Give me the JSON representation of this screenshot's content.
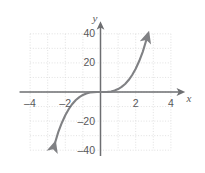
{
  "chart_data": {
    "type": "line",
    "title": "",
    "xlabel": "x",
    "ylabel": "y",
    "xlim": [
      -4.4,
      4.4
    ],
    "ylim": [
      -44,
      44
    ],
    "grid": true,
    "grid_style": "dotted",
    "legend": "none",
    "x_ticks": [
      -4,
      -2,
      2,
      4
    ],
    "x_tick_labels": [
      "–4",
      "–2",
      "2",
      "4"
    ],
    "y_ticks": [
      40,
      20,
      -20,
      -40
    ],
    "y_tick_labels": [
      "40",
      "20",
      "–20",
      "–40"
    ],
    "x_gridline_values": [
      -4,
      -3,
      -2,
      -1,
      0,
      1,
      2,
      3,
      4
    ],
    "y_gridline_values": [
      -40,
      -30,
      -20,
      -10,
      0,
      10,
      20,
      30,
      40
    ],
    "series": [
      {
        "name": "cubic",
        "equation": "y = x³",
        "arrow_start": true,
        "arrow_end": true,
        "x": [
          -2.65,
          -2.4,
          -2.2,
          -2.0,
          -1.8,
          -1.6,
          -1.4,
          -1.2,
          -1.0,
          -0.8,
          -0.6,
          -0.4,
          -0.2,
          0,
          0.2,
          0.4,
          0.6,
          0.8,
          1.0,
          1.2,
          1.4,
          1.6,
          1.8,
          2.0,
          2.2,
          2.4,
          2.65
        ],
        "y": [
          -37.6,
          -27.6,
          -21.3,
          -16.0,
          -11.7,
          -8.2,
          -5.5,
          -3.5,
          -2.0,
          -1.0,
          -0.4,
          -0.1,
          0.0,
          0,
          0.0,
          0.1,
          0.4,
          1.0,
          2.0,
          3.5,
          5.5,
          8.2,
          11.7,
          16.0,
          21.3,
          27.6,
          37.6
        ]
      }
    ]
  },
  "colors": {
    "curve": "#808184",
    "axis": "#6d6e71",
    "grid": "#d9d9d9",
    "text": "#58585a",
    "background": "#ffffff"
  },
  "axis_labels": {
    "x": "x",
    "y": "y"
  }
}
